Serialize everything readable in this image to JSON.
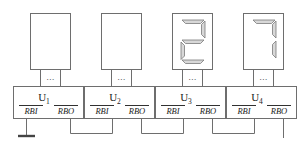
{
  "diagram": {
    "stage_count": 4,
    "colors": {
      "line": "#6e6e6e",
      "text": "#1a1a1a",
      "segment_fill": "#d8d8d8",
      "segment_stroke": "#7a7a7a",
      "background": "#ffffff"
    },
    "stages": [
      {
        "chip_label": "U",
        "chip_index": "1",
        "pin_in": "RBI",
        "pin_out": "RBO",
        "bus_dots": "...",
        "display_value": "",
        "display_blank": true,
        "segments": [],
        "rbi_source": "ground"
      },
      {
        "chip_label": "U",
        "chip_index": "2",
        "pin_in": "RBI",
        "pin_out": "RBO",
        "bus_dots": "...",
        "display_value": "",
        "display_blank": true,
        "segments": [],
        "rbi_source": "previous-rbo"
      },
      {
        "chip_label": "U",
        "chip_index": "3",
        "pin_in": "RBI",
        "pin_out": "RBO",
        "bus_dots": "...",
        "display_value": "2",
        "display_blank": false,
        "segments": [
          "a",
          "b",
          "g",
          "e",
          "d"
        ],
        "rbi_source": "previous-rbo"
      },
      {
        "chip_label": "U",
        "chip_index": "4",
        "pin_in": "RBI",
        "pin_out": "RBO",
        "bus_dots": "...",
        "display_value": "7",
        "display_blank": false,
        "segments": [
          "a",
          "b",
          "c"
        ],
        "rbi_source": "previous-rbo"
      }
    ],
    "ground_symbol": "ground-bar",
    "open_output": "U4 RBO unconnected"
  }
}
